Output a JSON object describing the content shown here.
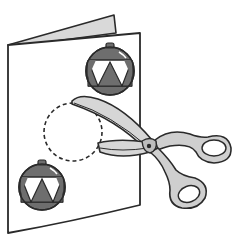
{
  "illustration": {
    "subject": "Greeting card with ornament decorations being cut with scissors",
    "elements": {
      "card": "folded-card",
      "ornaments": [
        "ornament-top",
        "ornament-bottom"
      ],
      "cut_guide": "dashed-circle",
      "tool": "scissors"
    },
    "colors": {
      "outline": "#2a2a2a",
      "card_fill": "#ffffff",
      "card_inner_fill": "#d9d9d9",
      "ornament_dark": "#6e6e6e",
      "ornament_light": "#ffffff",
      "scissor_blade": "#d6d6d6",
      "scissor_handle": "#cfcfcf"
    }
  }
}
